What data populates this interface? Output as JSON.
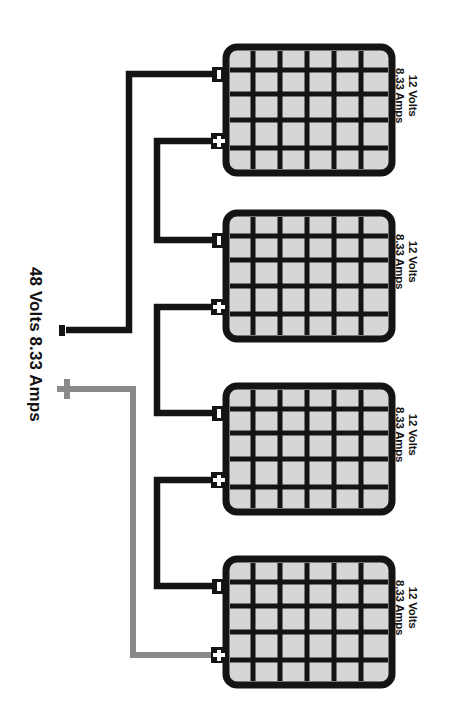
{
  "diagram": {
    "type": "series-battery-wiring",
    "source": {
      "label": "48 Volts 8.33 Amps",
      "negative_symbol": "-",
      "positive_symbol": "+"
    },
    "wire_colors": {
      "negative": "#141414",
      "positive": "#8a8a8a"
    },
    "battery_style": {
      "body_stroke": "#141414",
      "cell_fill": "#d6d6d6",
      "cell_stroke": "#141414",
      "grid_columns": 6,
      "grid_rows": 5
    },
    "batteries": [
      {
        "index": 1,
        "volts_line": "12 Volts",
        "amps_line": "8.33 Amps",
        "negative_symbol": "-",
        "positive_symbol": "+"
      },
      {
        "index": 2,
        "volts_line": "12 Volts",
        "amps_line": "8.33 Amps",
        "negative_symbol": "-",
        "positive_symbol": "+"
      },
      {
        "index": 3,
        "volts_line": "12 Volts",
        "amps_line": "8.33 Amps",
        "negative_symbol": "-",
        "positive_symbol": "+"
      },
      {
        "index": 4,
        "volts_line": "12 Volts",
        "amps_line": "8.33 Amps",
        "negative_symbol": "-",
        "positive_symbol": "+"
      }
    ]
  }
}
